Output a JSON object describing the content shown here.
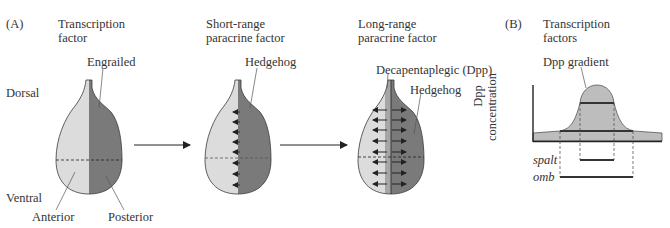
{
  "panel_a": {
    "label": "(A)",
    "orientation": {
      "dorsal": "Dorsal",
      "ventral": "Ventral"
    },
    "stage1": {
      "title_line1": "Transcription",
      "title_line2": "factor",
      "gene_label": "Engrailed",
      "anterior_label": "Anterior",
      "posterior_label": "Posterior"
    },
    "stage2": {
      "title_line1": "Short-range",
      "title_line2": "paracrine factor",
      "gene_label": "Hedgehog"
    },
    "stage3": {
      "title_line1": "Long-range",
      "title_line2": "paracrine factor",
      "gene_label_dpp": "Decapentaplegic (Dpp)",
      "gene_label_hh": "Hedgehog"
    }
  },
  "panel_b": {
    "label": "(B)",
    "title_line1": "Transcription",
    "title_line2": "factors",
    "curve_label": "Dpp gradient",
    "y_axis_line1": "Dpp",
    "y_axis_line2": "concentration",
    "genes": [
      {
        "name": "spalt"
      },
      {
        "name": "omb"
      }
    ]
  },
  "colors": {
    "anterior": "#dcdcdc",
    "posterior": "#7a7a7a",
    "dpp_stripe": "#a6a6a6",
    "outline": "#3a3a3a",
    "gradient_fill": "#bdbdbd",
    "threshold_bar": "#333333"
  }
}
